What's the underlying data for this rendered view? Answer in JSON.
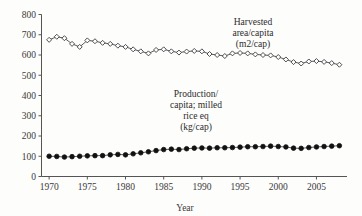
{
  "chart_data": {
    "type": "line",
    "title": "",
    "xlabel": "Year",
    "ylabel": "",
    "xlim": [
      1969,
      2009
    ],
    "ylim": [
      0,
      800
    ],
    "grid": false,
    "legend_position": "inline-annotation",
    "x_ticks": [
      "1970",
      "1975",
      "1980",
      "1985",
      "1990",
      "1995",
      "2000",
      "2005"
    ],
    "x_tick_values": [
      1970,
      1975,
      1980,
      1985,
      1990,
      1995,
      2000,
      2005
    ],
    "y_ticks": [
      "0",
      "100",
      "200",
      "300",
      "400",
      "500",
      "600",
      "700",
      "800"
    ],
    "y_tick_values": [
      0,
      100,
      200,
      300,
      400,
      500,
      600,
      700,
      800
    ],
    "x": [
      1970,
      1971,
      1972,
      1973,
      1974,
      1975,
      1976,
      1977,
      1978,
      1979,
      1980,
      1981,
      1982,
      1983,
      1984,
      1985,
      1986,
      1987,
      1988,
      1989,
      1990,
      1991,
      1992,
      1993,
      1994,
      1995,
      1996,
      1997,
      1998,
      1999,
      2000,
      2001,
      2002,
      2003,
      2004,
      2005,
      2006,
      2007,
      2008
    ],
    "series": [
      {
        "name": "Harvested area/capita (m2/cap)",
        "marker": "open-diamond",
        "values": [
          675,
          690,
          683,
          655,
          640,
          672,
          668,
          660,
          655,
          646,
          640,
          628,
          618,
          608,
          625,
          628,
          618,
          612,
          617,
          620,
          618,
          605,
          600,
          595,
          608,
          610,
          608,
          603,
          600,
          598,
          590,
          578,
          565,
          558,
          568,
          570,
          566,
          560,
          552
        ]
      },
      {
        "name": "Production/capita; milled rice eq (kg/cap)",
        "marker": "filled-circle",
        "values": [
          100,
          99,
          96,
          98,
          100,
          102,
          103,
          103,
          107,
          109,
          107,
          112,
          117,
          122,
          128,
          133,
          135,
          133,
          137,
          140,
          141,
          140,
          142,
          142,
          143,
          145,
          147,
          147,
          148,
          150,
          148,
          146,
          140,
          139,
          143,
          146,
          148,
          150,
          152
        ]
      }
    ],
    "annotations": [
      {
        "id": "harvested-area-annotation",
        "lines": [
          "Harvested",
          "area/capita",
          "(m2/cap)"
        ]
      },
      {
        "id": "production-capita-annotation",
        "lines": [
          "Production/",
          "capita; milled",
          "rice eq",
          "(kg/cap)"
        ]
      }
    ],
    "colors": {
      "axis": "#555555",
      "line": "#4a4a4a",
      "open_marker_fill": "#ffffff",
      "filled_marker": "#111111",
      "text": "#2b2b2b",
      "background": "#fdfdfc"
    }
  }
}
